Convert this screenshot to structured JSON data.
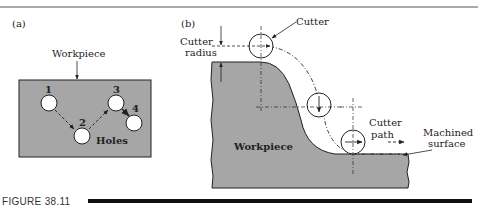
{
  "figure": {
    "caption": "FIGURE 38.11",
    "panel_a": {
      "label": "(a)",
      "workpiece_label": "Workpiece",
      "holes_label": "Holes",
      "hole_numbers": [
        "1",
        "2",
        "3",
        "4"
      ]
    },
    "panel_b": {
      "label": "(b)",
      "cutter_label": "Cutter",
      "cutter_radius_label_1": "Cutter",
      "cutter_radius_label_2": "radius",
      "cutter_path_label_1": "Cutter",
      "cutter_path_label_2": "path",
      "machined_surface_label_1": "Machined",
      "machined_surface_label_2": "surface",
      "workpiece_label": "Workpiece"
    },
    "colors": {
      "workpiece_fill": "#a6a6a6",
      "line": "#222222",
      "background": "#ffffff"
    }
  }
}
